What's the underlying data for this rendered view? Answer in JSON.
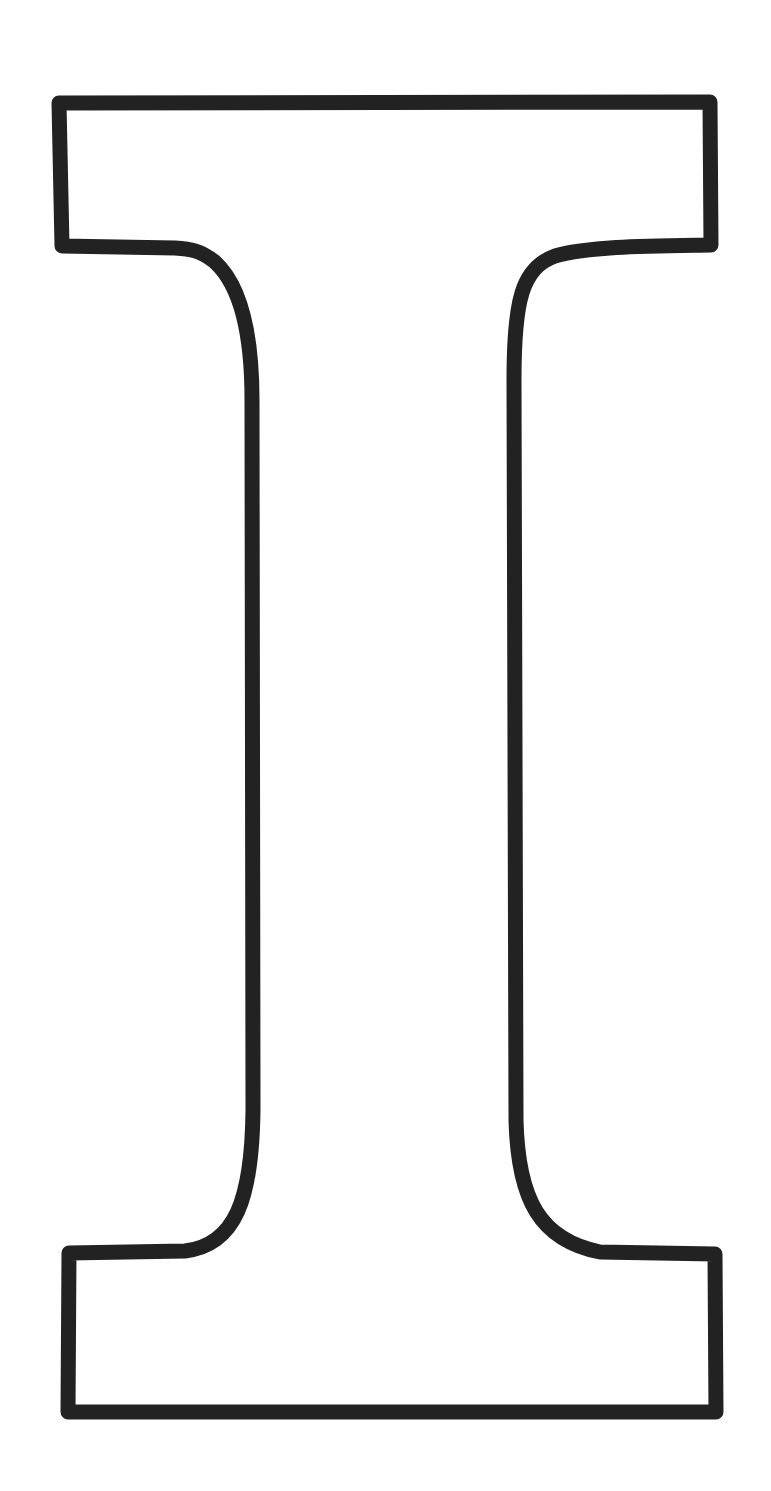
{
  "figure": {
    "label": "I",
    "colors": {
      "background": "#ffffff",
      "stroke": "#222222",
      "fill": "#ffffff"
    },
    "stroke_width": 15
  }
}
